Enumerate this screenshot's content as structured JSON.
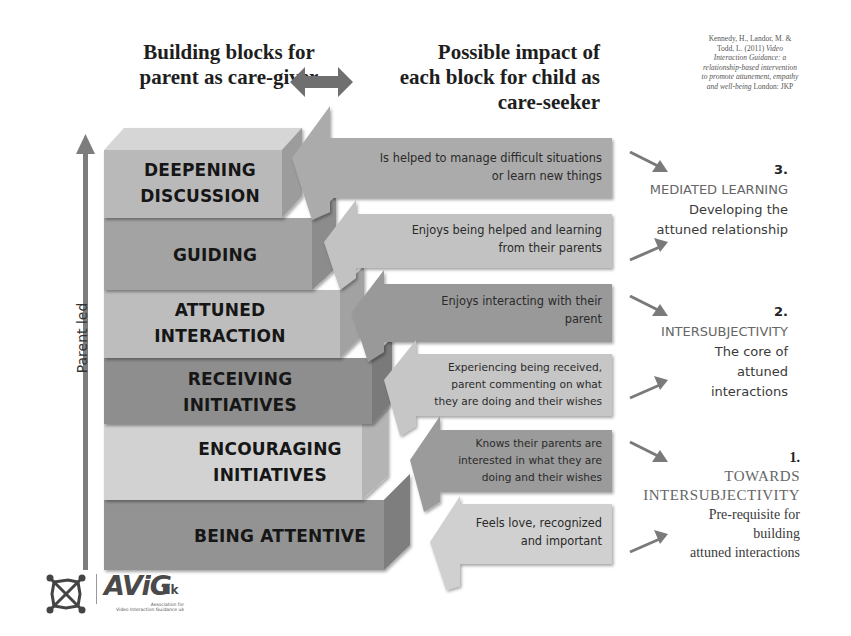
{
  "header": {
    "left_title_line1": "Building blocks for",
    "left_title_line2": "parent as care-giver",
    "right_title_line1": "Possible impact of",
    "right_title_line2": "each block for child as",
    "right_title_line3": "care-seeker",
    "connector_icon": "double-headed-arrow-icon"
  },
  "citation": {
    "line1": "Kennedy, H., Landor, M. &",
    "line2": "Todd, L. (2011)",
    "line2_italic": "Video",
    "line3_italic": "Interaction Guidance: a",
    "line4_italic": "relationship-based intervention",
    "line5_italic": "to promote attunement, empathy",
    "line6_italic": "and well-being",
    "line6": "London: JKP"
  },
  "axis": {
    "label": "Parent led",
    "icon": "up-arrow-icon"
  },
  "blocks": [
    {
      "line1": "DEEPENING",
      "line2": "DISCUSSION",
      "color": "#b9b9b9"
    },
    {
      "line1": "GUIDING",
      "line2": "",
      "color": "#a3a3a3"
    },
    {
      "line1": "ATTUNED",
      "line2": "INTERACTION",
      "color": "#bdbdbd"
    },
    {
      "line1": "RECEIVING",
      "line2": "INITIATIVES",
      "color": "#8e8e8e"
    },
    {
      "line1": "ENCOURAGING",
      "line2": "INITIATIVES",
      "color": "#d2d2d2"
    },
    {
      "line1": "BEING ATTENTIVE",
      "line2": "",
      "color": "#939393"
    }
  ],
  "impacts": [
    {
      "line1": "Is helped to manage difficult situations",
      "line2": "or learn new things",
      "line3": "",
      "color": "#ababab"
    },
    {
      "line1": "Enjoys being helped and learning",
      "line2": "from their parents",
      "line3": "",
      "color": "#c2c2c2"
    },
    {
      "line1": "Enjoys interacting with their",
      "line2": "parent",
      "line3": "",
      "color": "#999999"
    },
    {
      "line1": "Experiencing being received,",
      "line2": "parent commenting on what",
      "line3": "they are doing and their wishes",
      "color": "#c6c6c6"
    },
    {
      "line1": "Knows their parents are",
      "line2": "interested in what they are",
      "line3": "doing and their wishes",
      "color": "#9b9b9b"
    },
    {
      "line1": "Feels love, recognized",
      "line2": "and important",
      "line3": "",
      "color": "#d0d0d0"
    }
  ],
  "stages": [
    {
      "number": "3.",
      "title": "MEDIATED LEARNING",
      "desc1": "Developing the",
      "desc2": "attuned relationship",
      "desc3": ""
    },
    {
      "number": "2.",
      "title": "INTERSUBJECTIVITY",
      "desc1": "The core of",
      "desc2": "attuned",
      "desc3": "interactions"
    },
    {
      "number": "1.",
      "title_line1": "TOWARDS",
      "title_line2": "INTERSUBJECTIVITY",
      "desc1": "Pre-requisite for",
      "desc2": "building",
      "desc3": "attuned  interactions"
    }
  ],
  "logo": {
    "brand": "AViG",
    "suffix": "uk",
    "subtitle_line1": "Association for",
    "subtitle_line2": "Video Interaction Guidance uk"
  }
}
